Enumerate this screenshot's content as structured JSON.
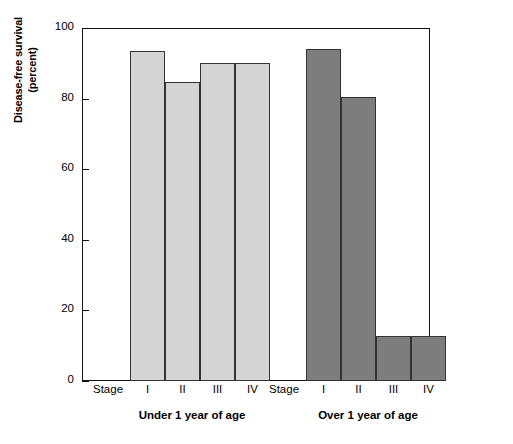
{
  "chart_data": {
    "type": "bar",
    "title": "",
    "subtitle": "",
    "xlabel": "",
    "ylabel_line1": "Disease-free survival",
    "ylabel_line2": "(percent)",
    "ylim": [
      0,
      100
    ],
    "yticks": [
      0,
      20,
      40,
      60,
      80,
      100
    ],
    "ytick_labels": [
      "0",
      "20",
      "40",
      "60",
      "80",
      "100"
    ],
    "grid": false,
    "legend_position": "none",
    "stage_prefix_label": "Stage",
    "categories": [
      "I",
      "II",
      "III",
      "IV"
    ],
    "groups": [
      {
        "name": "Under 1 year of age",
        "color": "#d4d4d4",
        "values": [
          93.5,
          84.7,
          90.2,
          90.2
        ]
      },
      {
        "name": "Over 1 year of age",
        "color": "#7d7d7d",
        "values": [
          94.0,
          80.5,
          12.8,
          12.8
        ]
      }
    ],
    "annotations": []
  },
  "colors": {
    "axis": "#111111",
    "bar_edge": "#333333",
    "light_bar": "#d4d4d4",
    "dark_bar": "#7d7d7d",
    "background": "#ffffff"
  }
}
